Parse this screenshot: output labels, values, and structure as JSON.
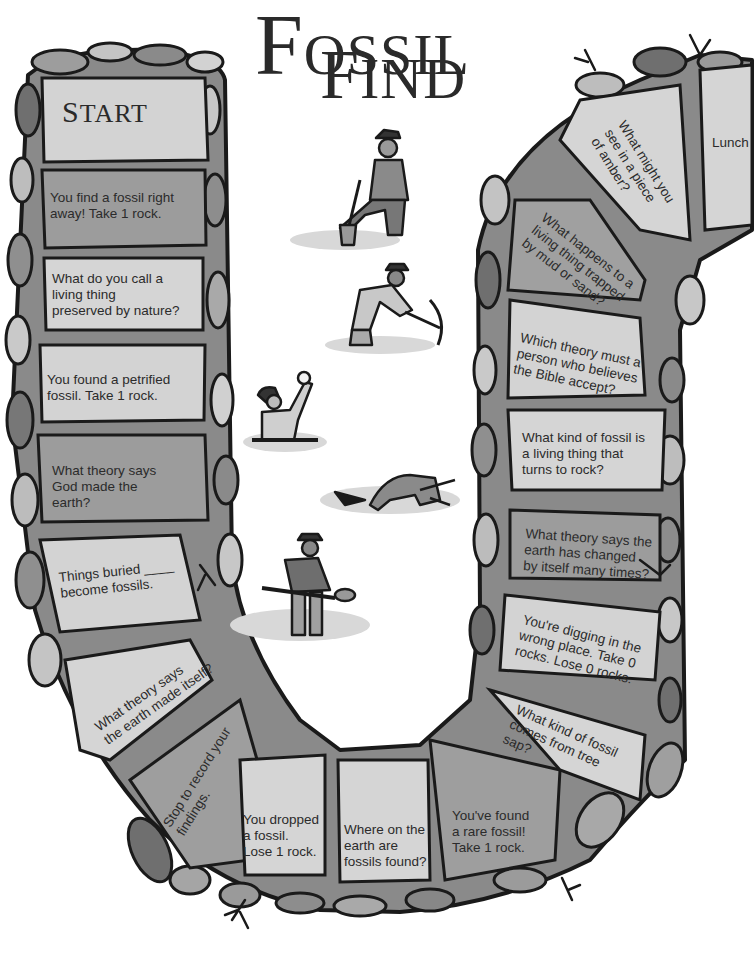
{
  "title": {
    "line1_initial": "F",
    "line1_rest": "OSSIL",
    "line2_initial": "F",
    "line2_rest": "IND"
  },
  "colors": {
    "rock_dark": "#6e6e6e",
    "rock_mid": "#9a9a9a",
    "rock_light": "#c9c9c9",
    "tile_light": "#d6d6d6",
    "tile_mid": "#a8a8a8",
    "outline": "#1a1a1a",
    "text": "#2b2b2b"
  },
  "spaces": [
    {
      "id": "start",
      "label_initial": "S",
      "label_rest": "TART"
    },
    {
      "id": "s1",
      "text": "You find a fossil right\naway! Take 1 rock."
    },
    {
      "id": "s2",
      "text": "What do you call a\nliving thing\npreserved by nature?"
    },
    {
      "id": "s3",
      "text": "You found a petrified\nfossil. Take 1 rock."
    },
    {
      "id": "s4",
      "text": "What theory says\nGod made the\nearth?"
    },
    {
      "id": "s5",
      "text": "Things buried ____\nbecome fossils."
    },
    {
      "id": "s6",
      "text": "What theory says\nthe earth made itself?"
    },
    {
      "id": "s7",
      "text": "Stop to record your\nfindings."
    },
    {
      "id": "s8",
      "text": "You dropped\na fossil.\nLose 1 rock."
    },
    {
      "id": "s9",
      "text": "Where on the\nearth are\nfossils found?"
    },
    {
      "id": "s10",
      "text": "You've found\na rare fossil!\nTake 1 rock."
    },
    {
      "id": "s11",
      "text": "What kind of fossil\ncomes from tree\nsap?"
    },
    {
      "id": "s12",
      "text": "You're digging in the\nwrong place. Take 0\nrocks. Lose 0 rocks."
    },
    {
      "id": "s13",
      "text": "What theory says the\nearth has changed\nby itself many times?"
    },
    {
      "id": "s14",
      "text": "What kind of fossil is\na living thing that\nturns to rock?"
    },
    {
      "id": "s15",
      "text": "Which theory must a\nperson who believes\nthe Bible accept?"
    },
    {
      "id": "s16",
      "text": "What happens to a\nliving thing trapped\nby mud or sand?"
    },
    {
      "id": "s17",
      "text": "What might you\nsee in a piece\nof amber?"
    },
    {
      "id": "lunch",
      "text": "Lunch"
    }
  ],
  "illustrations": [
    "digger-with-shovel",
    "digger-with-pickaxe",
    "person-holding-skull",
    "person-crawling",
    "person-sifting-with-pan"
  ]
}
